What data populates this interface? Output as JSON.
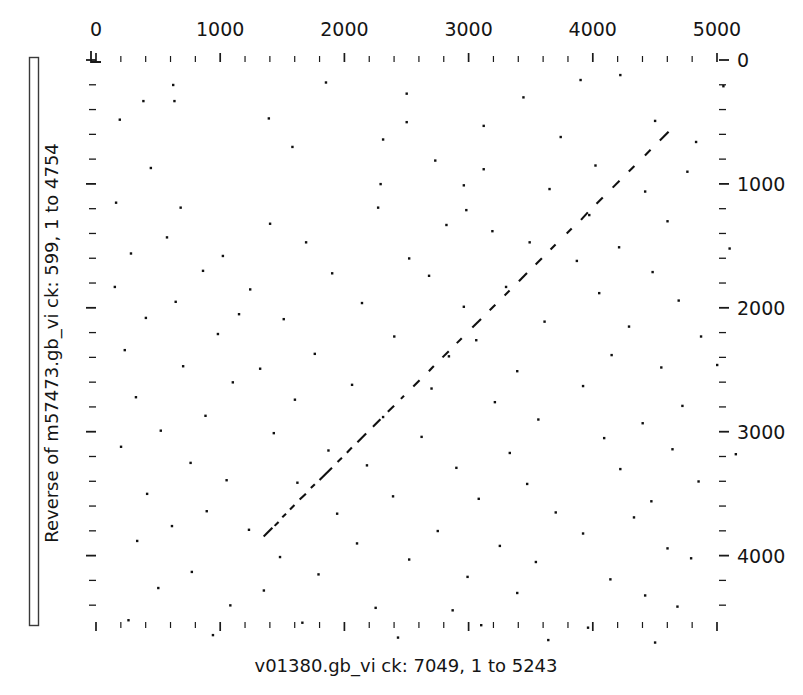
{
  "figure": {
    "kind": "dot-plot",
    "background_color": "#ffffff",
    "ink_color": "#101010"
  },
  "axes": {
    "x": {
      "title": "v01380.gb_vi ck: 7049, 1 to 5243",
      "title_position": "bottom",
      "tick_labels_position": "top",
      "tick_labels": [
        "0",
        "1000",
        "2000",
        "3000",
        "4000",
        "5000"
      ],
      "tick_values": [
        0,
        1000,
        2000,
        3000,
        4000,
        5000
      ],
      "minor_tick_interval": 200,
      "range": [
        0,
        5243
      ],
      "pixel_start": 96,
      "pixel_end": 717
    },
    "y": {
      "title": "Reverse of m57473.gb_vi ck: 599, 1 to 4754",
      "title_position": "left",
      "tick_labels_position": "right",
      "tick_labels": [
        "0",
        "1000",
        "2000",
        "3000",
        "4000"
      ],
      "tick_values": [
        0,
        1000,
        2000,
        3000,
        4000
      ],
      "minor_tick_interval": 200,
      "range": [
        0,
        4754
      ],
      "pixel_start": 60,
      "pixel_end": 625,
      "direction": "top-to-bottom-increasing"
    }
  },
  "chart_data": {
    "type": "scatter",
    "title": "",
    "subtitle": "",
    "xlabel": "v01380.gb_vi ck: 7049, 1 to 5243",
    "ylabel": "Reverse of m57473.gb_vi ck: 599, 1 to 4754",
    "xlim": [
      0,
      5243
    ],
    "ylim": [
      0,
      4754
    ],
    "grid": false,
    "legend": "none",
    "x_tick_labels": [
      "0",
      "1000",
      "2000",
      "3000",
      "4000",
      "5000"
    ],
    "y_tick_labels": [
      "0",
      "1000",
      "2000",
      "3000",
      "4000"
    ],
    "series": [
      {
        "name": "diagonal-match-segments",
        "description": "Broken anti-parallel diagonal of homology running from lower-left to upper-right",
        "segments": [
          [
            1350,
            3845,
            1420,
            3775
          ],
          [
            1438,
            3760,
            1470,
            3728
          ],
          [
            1500,
            3690,
            1530,
            3662
          ],
          [
            1562,
            3628,
            1598,
            3592
          ],
          [
            1640,
            3548,
            1690,
            3500
          ],
          [
            1730,
            3455,
            1762,
            3424
          ],
          [
            1800,
            3390,
            1900,
            3290
          ],
          [
            1945,
            3244,
            1980,
            3210
          ],
          [
            2020,
            3170,
            2060,
            3128
          ],
          [
            2105,
            3085,
            2175,
            3015
          ],
          [
            2230,
            2960,
            2290,
            2900
          ],
          [
            2350,
            2838,
            2400,
            2790
          ],
          [
            2455,
            2735,
            2480,
            2710
          ],
          [
            2555,
            2635,
            2605,
            2585
          ],
          [
            2680,
            2512,
            2720,
            2470
          ],
          [
            2790,
            2400,
            2840,
            2350
          ],
          [
            2905,
            2285,
            2945,
            2245
          ],
          [
            3030,
            2158,
            3100,
            2090
          ],
          [
            3170,
            2020,
            3215,
            1975
          ],
          [
            3290,
            1900,
            3330,
            1860
          ],
          [
            3405,
            1785,
            3470,
            1720
          ],
          [
            3540,
            1650,
            3590,
            1600
          ],
          [
            3660,
            1530,
            3700,
            1490
          ],
          [
            3790,
            1400,
            3830,
            1360
          ],
          [
            3905,
            1290,
            3960,
            1230
          ],
          [
            4030,
            1160,
            4080,
            1110
          ],
          [
            4160,
            1030,
            4215,
            975
          ],
          [
            4290,
            900,
            4335,
            855
          ],
          [
            4420,
            770,
            4465,
            725
          ],
          [
            4540,
            650,
            4610,
            580
          ]
        ]
      },
      {
        "name": "background-noise-dots",
        "description": "Sparse random single-pixel chance matches scattered across the field",
        "points": [
          [
            380,
            330
          ],
          [
            630,
            330
          ],
          [
            2500,
            270
          ],
          [
            3440,
            300
          ],
          [
            4220,
            120
          ],
          [
            190,
            480
          ],
          [
            1390,
            470
          ],
          [
            2500,
            500
          ],
          [
            3120,
            530
          ],
          [
            4500,
            490
          ],
          [
            2310,
            640
          ],
          [
            3740,
            620
          ],
          [
            4830,
            660
          ],
          [
            1580,
            700
          ],
          [
            440,
            870
          ],
          [
            2730,
            810
          ],
          [
            3120,
            880
          ],
          [
            4020,
            850
          ],
          [
            4760,
            900
          ],
          [
            2290,
            1000
          ],
          [
            2960,
            1010
          ],
          [
            3650,
            1040
          ],
          [
            4420,
            1060
          ],
          [
            160,
            1150
          ],
          [
            680,
            1190
          ],
          [
            2270,
            1190
          ],
          [
            2980,
            1210
          ],
          [
            3970,
            1250
          ],
          [
            1400,
            1320
          ],
          [
            2820,
            1330
          ],
          [
            3190,
            1380
          ],
          [
            4600,
            1300
          ],
          [
            570,
            1430
          ],
          [
            1690,
            1470
          ],
          [
            3490,
            1470
          ],
          [
            4210,
            1510
          ],
          [
            280,
            1560
          ],
          [
            1020,
            1580
          ],
          [
            2520,
            1600
          ],
          [
            3870,
            1620
          ],
          [
            860,
            1700
          ],
          [
            1900,
            1720
          ],
          [
            2680,
            1740
          ],
          [
            4480,
            1710
          ],
          [
            150,
            1830
          ],
          [
            1240,
            1850
          ],
          [
            3300,
            1830
          ],
          [
            4050,
            1880
          ],
          [
            640,
            1950
          ],
          [
            2140,
            1960
          ],
          [
            2960,
            1990
          ],
          [
            4690,
            1940
          ],
          [
            400,
            2080
          ],
          [
            1510,
            2090
          ],
          [
            3610,
            2110
          ],
          [
            4290,
            2150
          ],
          [
            980,
            2210
          ],
          [
            2400,
            2230
          ],
          [
            3060,
            2260
          ],
          [
            4870,
            2230
          ],
          [
            230,
            2340
          ],
          [
            1760,
            2370
          ],
          [
            2840,
            2390
          ],
          [
            4150,
            2380
          ],
          [
            700,
            2470
          ],
          [
            1320,
            2490
          ],
          [
            3390,
            2510
          ],
          [
            4550,
            2480
          ],
          [
            1100,
            2600
          ],
          [
            2060,
            2620
          ],
          [
            2700,
            2650
          ],
          [
            3920,
            2630
          ],
          [
            320,
            2720
          ],
          [
            1600,
            2740
          ],
          [
            3210,
            2760
          ],
          [
            4720,
            2790
          ],
          [
            880,
            2870
          ],
          [
            2310,
            2880
          ],
          [
            3560,
            2900
          ],
          [
            4400,
            2930
          ],
          [
            520,
            2990
          ],
          [
            1430,
            3010
          ],
          [
            2620,
            3040
          ],
          [
            4090,
            3050
          ],
          [
            200,
            3120
          ],
          [
            1870,
            3150
          ],
          [
            3330,
            3170
          ],
          [
            4640,
            3140
          ],
          [
            760,
            3250
          ],
          [
            2180,
            3270
          ],
          [
            2900,
            3290
          ],
          [
            4220,
            3300
          ],
          [
            1050,
            3390
          ],
          [
            1620,
            3410
          ],
          [
            3470,
            3420
          ],
          [
            4850,
            3400
          ],
          [
            410,
            3500
          ],
          [
            2390,
            3520
          ],
          [
            3080,
            3540
          ],
          [
            4470,
            3560
          ],
          [
            890,
            3640
          ],
          [
            1940,
            3660
          ],
          [
            3700,
            3650
          ],
          [
            4330,
            3690
          ],
          [
            610,
            3760
          ],
          [
            1230,
            3790
          ],
          [
            2750,
            3800
          ],
          [
            3920,
            3820
          ],
          [
            330,
            3880
          ],
          [
            2100,
            3900
          ],
          [
            3250,
            3920
          ],
          [
            4600,
            3940
          ],
          [
            1480,
            4010
          ],
          [
            2520,
            4030
          ],
          [
            3540,
            4050
          ],
          [
            4790,
            4020
          ],
          [
            770,
            4130
          ],
          [
            1790,
            4150
          ],
          [
            2990,
            4170
          ],
          [
            4140,
            4190
          ],
          [
            500,
            4260
          ],
          [
            1350,
            4280
          ],
          [
            3390,
            4300
          ],
          [
            4420,
            4320
          ],
          [
            1080,
            4400
          ],
          [
            2250,
            4420
          ],
          [
            2870,
            4440
          ],
          [
            4680,
            4410
          ],
          [
            260,
            4520
          ],
          [
            1660,
            4540
          ],
          [
            3100,
            4560
          ],
          [
            3960,
            4580
          ],
          [
            940,
            4640
          ],
          [
            2430,
            4660
          ],
          [
            3640,
            4680
          ],
          [
            4500,
            4700
          ],
          [
            620,
            200
          ],
          [
            1850,
            180
          ],
          [
            3900,
            160
          ],
          [
            5050,
            210
          ],
          [
            1150,
            2050
          ],
          [
            5100,
            1520
          ],
          [
            5150,
            3180
          ],
          [
            5000,
            2460
          ]
        ]
      }
    ]
  },
  "decorations": {
    "left_sidebar_label": "vertical-ruler-bar",
    "origin_corner_marker": "L-shaped corner tick at plot origin"
  }
}
